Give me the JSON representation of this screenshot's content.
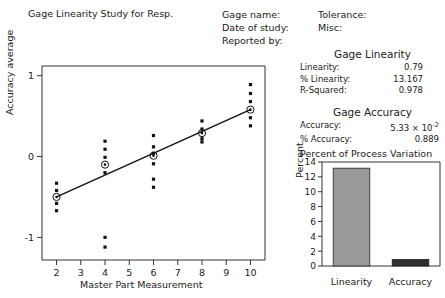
{
  "report": {
    "title": "Gage Linearity Study for Resp."
  },
  "header": {
    "labels": [
      "Gage name:",
      "Date of study:",
      "Reported by:"
    ],
    "values": [
      "Tolerance:",
      "Misc:"
    ]
  },
  "stats": {
    "linearity": {
      "heading": "Gage Linearity",
      "rows": [
        {
          "label": "Linearity:",
          "value": "0.79"
        },
        {
          "label": "% Linearity:",
          "value": "13.167"
        },
        {
          "label": "R-Squared:",
          "value": "0.978"
        }
      ]
    },
    "accuracy": {
      "heading": "Gage Accuracy",
      "rows": [
        {
          "label": "Accuracy:",
          "value": "5.33 × 10",
          "exponent": "-2"
        },
        {
          "label": "% Accuracy:",
          "value": "0.889",
          "exponent": ""
        }
      ]
    }
  },
  "chart_data": [
    {
      "type": "scatter",
      "name": "gage-linearity-scatter",
      "title": "",
      "xlabel": "Master Part Measurement",
      "ylabel": "Accuracy average",
      "xlim": [
        1.4,
        10.6
      ],
      "ylim": [
        -1.28,
        1.12
      ],
      "xticks": [
        2,
        3,
        4,
        5,
        6,
        7,
        8,
        9,
        10
      ],
      "yticks": [
        1,
        0,
        -1
      ],
      "grid": false,
      "points": [
        {
          "x": 2,
          "y": -0.33
        },
        {
          "x": 2,
          "y": -0.42
        },
        {
          "x": 2,
          "y": -0.58
        },
        {
          "x": 2,
          "y": -0.67
        },
        {
          "x": 4,
          "y": 0.19
        },
        {
          "x": 4,
          "y": 0.09
        },
        {
          "x": 4,
          "y": -0.01
        },
        {
          "x": 4,
          "y": -0.2
        },
        {
          "x": 4,
          "y": -1.0
        },
        {
          "x": 4,
          "y": -1.12
        },
        {
          "x": 6,
          "y": 0.26
        },
        {
          "x": 6,
          "y": 0.12
        },
        {
          "x": 6,
          "y": 0.04
        },
        {
          "x": 6,
          "y": -0.09
        },
        {
          "x": 6,
          "y": -0.28
        },
        {
          "x": 6,
          "y": -0.38
        },
        {
          "x": 8,
          "y": 0.44
        },
        {
          "x": 8,
          "y": 0.34
        },
        {
          "x": 8,
          "y": 0.22
        },
        {
          "x": 8,
          "y": 0.18
        },
        {
          "x": 10,
          "y": 0.89
        },
        {
          "x": 10,
          "y": 0.78
        },
        {
          "x": 10,
          "y": 0.68
        },
        {
          "x": 10,
          "y": 0.48
        },
        {
          "x": 10,
          "y": 0.38
        }
      ],
      "means": [
        {
          "x": 2,
          "y": -0.5
        },
        {
          "x": 4,
          "y": -0.1
        },
        {
          "x": 6,
          "y": 0.01
        },
        {
          "x": 8,
          "y": 0.29
        },
        {
          "x": 10,
          "y": 0.58
        }
      ],
      "fit_line": {
        "x1": 2,
        "y1": -0.5,
        "x2": 10,
        "y2": 0.58
      }
    },
    {
      "type": "bar",
      "name": "percent-of-process-variation",
      "title": "Percent of Process Variation",
      "xlabel": "",
      "ylabel": "Percent",
      "categories": [
        "Linearity",
        "Accuracy"
      ],
      "values": [
        13.167,
        0.889
      ],
      "ylim": [
        0,
        14
      ],
      "yticks": [
        0,
        2,
        4,
        6,
        8,
        10,
        12,
        14
      ],
      "grid": false,
      "colors": [
        "#9a9a9a",
        "#2e2e2e"
      ]
    }
  ]
}
